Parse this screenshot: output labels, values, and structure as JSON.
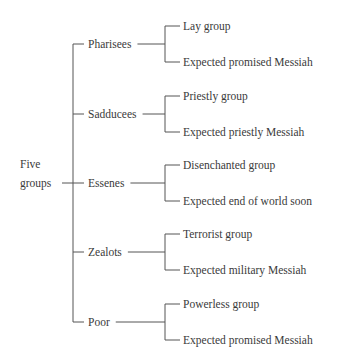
{
  "diagram": {
    "root": {
      "line1": "Five",
      "line2": "groups"
    },
    "groups": [
      {
        "name": "Pharisees",
        "children": [
          "Lay group",
          "Expected promised Messiah"
        ]
      },
      {
        "name": "Sadducees",
        "children": [
          "Priestly group",
          "Expected priestly Messiah"
        ]
      },
      {
        "name": "Essenes",
        "children": [
          "Disenchanted group",
          "Expected end of world soon"
        ]
      },
      {
        "name": "Zealots",
        "children": [
          "Terrorist group",
          "Expected military Messiah"
        ]
      },
      {
        "name": "Poor",
        "children": [
          "Powerless group",
          "Expected promised Messiah"
        ]
      }
    ]
  }
}
